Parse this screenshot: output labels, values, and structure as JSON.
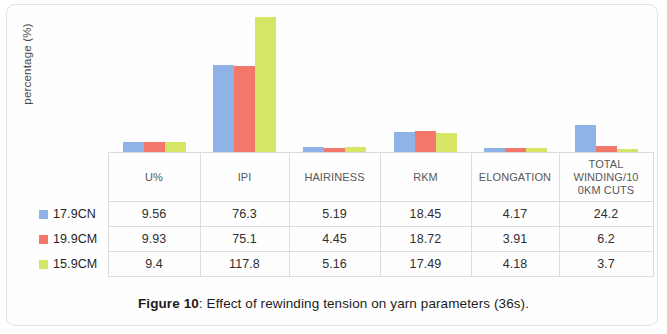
{
  "figure": {
    "caption_label": "Figure 10",
    "caption_sep": ":",
    "caption_text": " Effect of rewinding tension on yarn parameters (36s)."
  },
  "colors": {
    "series1": "#8FB3E6",
    "series2": "#F4776B",
    "series3": "#D6E566",
    "table_border": "#dddddd",
    "text": "#2f2f2f"
  },
  "chart_data": {
    "type": "bar",
    "title": "",
    "subtitle": "",
    "xlabel": "",
    "ylabel": "percentage (%)",
    "ylim": [
      0,
      120
    ],
    "grid": false,
    "legend_position": "table-left",
    "categories": [
      "U%",
      "IPI",
      "HAIRINESS",
      "RKM",
      "ELONGATION",
      "TOTAL WINDING/100KM CUTS"
    ],
    "series": [
      {
        "name": "17.9CN",
        "color": "#8FB3E6",
        "values": [
          9.56,
          76.3,
          5.19,
          18.45,
          4.17,
          24.2
        ]
      },
      {
        "name": "19.9CM",
        "color": "#F4776B",
        "values": [
          9.93,
          75.1,
          4.45,
          18.72,
          3.91,
          6.2
        ]
      },
      {
        "name": "15.9CM",
        "color": "#D6E566",
        "values": [
          9.4,
          117.8,
          5.16,
          17.49,
          4.18,
          3.7
        ]
      }
    ]
  },
  "table": {
    "corner_header": "",
    "headers": [
      "U%",
      "IPI",
      "HAIRINESS",
      "RKM",
      "ELONGATION",
      "TOTAL WINDING/100KM CUTS"
    ],
    "header_display": [
      "U%",
      "IPI",
      "HAIRINESS",
      "RKM",
      "ELONGATION",
      "TOTAL\nWINDING/10\n0KM CUTS"
    ],
    "rows": [
      {
        "label": "17.9CN",
        "color": "#8FB3E6",
        "cells": [
          "9.56",
          "76.3",
          "5.19",
          "18.45",
          "4.17",
          "24.2"
        ]
      },
      {
        "label": "19.9CM",
        "color": "#F4776B",
        "cells": [
          "9.93",
          "75.1",
          "4.45",
          "18.72",
          "3.91",
          "6.2"
        ]
      },
      {
        "label": "15.9CM",
        "color": "#D6E566",
        "cells": [
          "9.4",
          "117.8",
          "5.16",
          "17.49",
          "4.18",
          "3.7"
        ]
      }
    ]
  }
}
